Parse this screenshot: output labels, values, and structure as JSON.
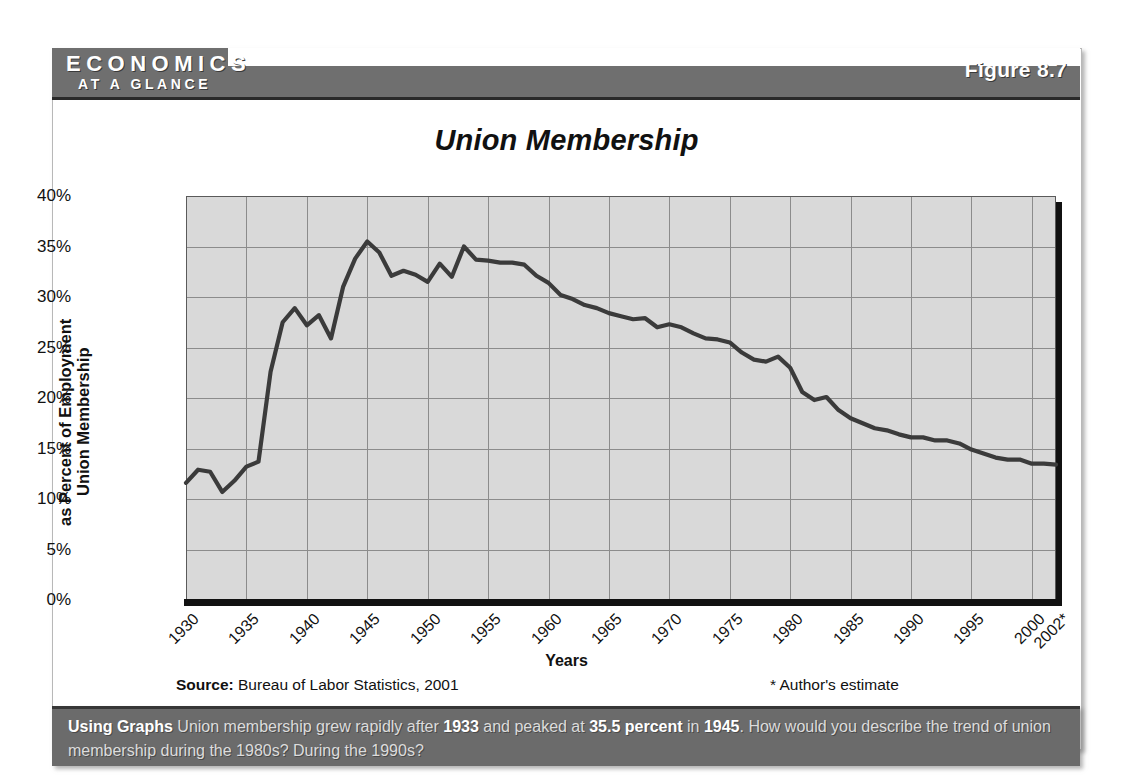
{
  "banner": {
    "brand_line1": "ECONOMICS",
    "brand_line2": "AT A GLANCE",
    "figure_label": "Figure 8.7"
  },
  "chart_data": {
    "type": "line",
    "title": "Union Membership",
    "xlabel": "Years",
    "ylabel": "Union Membership as Percent of Employment",
    "ylabel_line1": "Union Membership",
    "ylabel_line2": "as Percent of Employment",
    "ylim": [
      0,
      40
    ],
    "xlim": [
      1930,
      2002
    ],
    "grid": true,
    "legend": "none",
    "ytick_labels": [
      "40%",
      "35%",
      "30%",
      "25%",
      "20%",
      "15%",
      "10%",
      "5%",
      "0%"
    ],
    "ytick_values": [
      40,
      35,
      30,
      25,
      20,
      15,
      10,
      5,
      0
    ],
    "xtick_labels": [
      "1930",
      "1935",
      "1940",
      "1945",
      "1950",
      "1955",
      "1960",
      "1965",
      "1970",
      "1975",
      "1980",
      "1985",
      "1990",
      "1995",
      "2000",
      "2002*"
    ],
    "xtick_values": [
      1930,
      1935,
      1940,
      1945,
      1950,
      1955,
      1960,
      1965,
      1970,
      1975,
      1980,
      1985,
      1990,
      1995,
      2000,
      2002
    ],
    "series_name": "Union membership as percent of employment",
    "x": [
      1930,
      1931,
      1932,
      1933,
      1934,
      1935,
      1936,
      1937,
      1938,
      1939,
      1940,
      1941,
      1942,
      1943,
      1944,
      1945,
      1946,
      1947,
      1948,
      1949,
      1950,
      1951,
      1952,
      1953,
      1954,
      1955,
      1956,
      1957,
      1958,
      1959,
      1960,
      1961,
      1962,
      1963,
      1964,
      1965,
      1966,
      1967,
      1968,
      1969,
      1970,
      1971,
      1972,
      1973,
      1974,
      1975,
      1976,
      1977,
      1978,
      1979,
      1980,
      1981,
      1982,
      1983,
      1984,
      1985,
      1986,
      1987,
      1988,
      1989,
      1990,
      1991,
      1992,
      1993,
      1994,
      1995,
      1996,
      1997,
      1998,
      1999,
      2000,
      2001,
      2002
    ],
    "values": [
      11.6,
      12.9,
      12.7,
      10.7,
      11.8,
      13.2,
      13.7,
      22.6,
      27.5,
      28.9,
      27.2,
      28.2,
      25.9,
      31.0,
      33.8,
      35.5,
      34.4,
      32.1,
      32.6,
      32.2,
      31.5,
      33.3,
      32.0,
      35.0,
      33.7,
      33.6,
      33.4,
      33.4,
      33.2,
      32.1,
      31.4,
      30.2,
      29.8,
      29.2,
      28.9,
      28.4,
      28.1,
      27.8,
      27.9,
      27.0,
      27.3,
      27.0,
      26.4,
      25.9,
      25.8,
      25.5,
      24.5,
      23.8,
      23.6,
      24.1,
      23.0,
      20.6,
      19.8,
      20.1,
      18.8,
      18.0,
      17.5,
      17.0,
      16.8,
      16.4,
      16.1,
      16.1,
      15.8,
      15.8,
      15.5,
      14.9,
      14.5,
      14.1,
      13.9,
      13.9,
      13.5,
      13.5,
      13.4
    ],
    "peak": {
      "year": 1945,
      "value": 35.5
    },
    "source": "Bureau of Labor Statistics, 2001",
    "source_prefix": "Source:",
    "estimate_note": "* Author's estimate",
    "line_color": "#3b3b3b",
    "plot_bg": "#d9d9d9",
    "grid_color": "#8c8c8c"
  },
  "caption": {
    "lead": "Using Graphs",
    "text_part1": "Union membership grew rapidly after ",
    "hl1": "1933",
    "text_part2": " and peaked at ",
    "hl2": "35.5 percent",
    "text_part3": " in ",
    "hl3": "1945",
    "text_part4": ". How would you describe the trend of union membership during the 1980s? During the 1990s?"
  }
}
